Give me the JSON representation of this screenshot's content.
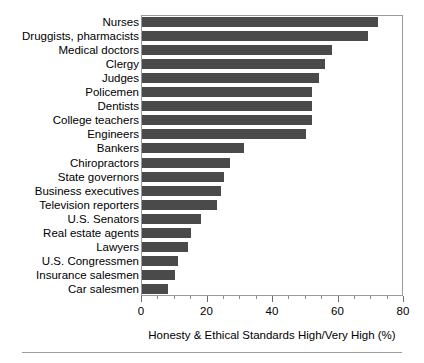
{
  "chart_data": {
    "type": "bar",
    "orientation": "horizontal",
    "title": "",
    "subtitle": "",
    "xlabel": "Honesty & Ethical Standards High/Very High (%)",
    "ylabel": "",
    "xlim": [
      0,
      80
    ],
    "xticks": [
      0,
      20,
      40,
      60,
      80
    ],
    "xticklabels": [
      "0",
      "20",
      "40",
      "60",
      "80"
    ],
    "minor_tick_interval": 5,
    "grid": false,
    "legend": null,
    "bar_color": "#4a4a4a",
    "frame_color": "#9a9a9a",
    "categories": [
      "Nurses",
      "Druggists, pharmacists",
      "Medical doctors",
      "Clergy",
      "Judges",
      "Policemen",
      "Dentists",
      "College teachers",
      "Engineers",
      "Bankers",
      "Chiropractors",
      "State governors",
      "Business executives",
      "Television reporters",
      "U.S. Senators",
      "Real estate agents",
      "Lawyers",
      "U.S. Congressmen",
      "Insurance salesmen",
      "Car salesmen"
    ],
    "values": [
      72,
      69,
      58,
      56,
      54,
      52,
      52,
      52,
      50,
      31,
      27,
      25,
      24,
      23,
      18,
      15,
      14,
      11,
      10,
      8
    ]
  },
  "axis_title_text": "Honesty & Ethical Standards High/Very High (%)"
}
